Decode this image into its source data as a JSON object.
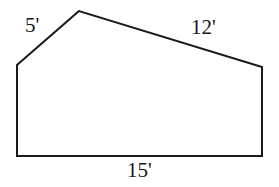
{
  "figure": {
    "kind": "geometry-diagram",
    "shape_name": "pentagon",
    "background_color": "#ffffff",
    "stroke_color": "#1a1a1a",
    "stroke_width": 2,
    "fill_color": "#ffffff",
    "vertices": [
      {
        "name": "apex",
        "x": 79,
        "y": 11
      },
      {
        "name": "upper-left",
        "x": 17,
        "y": 65
      },
      {
        "name": "lower-left",
        "x": 17,
        "y": 156
      },
      {
        "name": "lower-right",
        "x": 262,
        "y": 156
      },
      {
        "name": "upper-right",
        "x": 262,
        "y": 67
      }
    ],
    "path": "M 79 11 L 17 65 L 17 156 L 262 156 L 262 67 Z",
    "labels": {
      "left_slant": "5'",
      "right_slant": "12'",
      "base": "15'"
    }
  },
  "chart_data": {
    "type": "diagram",
    "title": "",
    "shape": "pentagon",
    "labeled_sides": [
      {
        "side": "upper-left slanted edge",
        "label": "5'",
        "value": 5,
        "unit": "feet"
      },
      {
        "side": "upper-right slanted edge",
        "label": "12'",
        "value": 12,
        "unit": "feet"
      },
      {
        "side": "bottom edge",
        "label": "15'",
        "value": 15,
        "unit": "feet"
      }
    ],
    "unlabeled_sides": [
      {
        "side": "left vertical edge"
      },
      {
        "side": "right vertical edge"
      }
    ]
  }
}
